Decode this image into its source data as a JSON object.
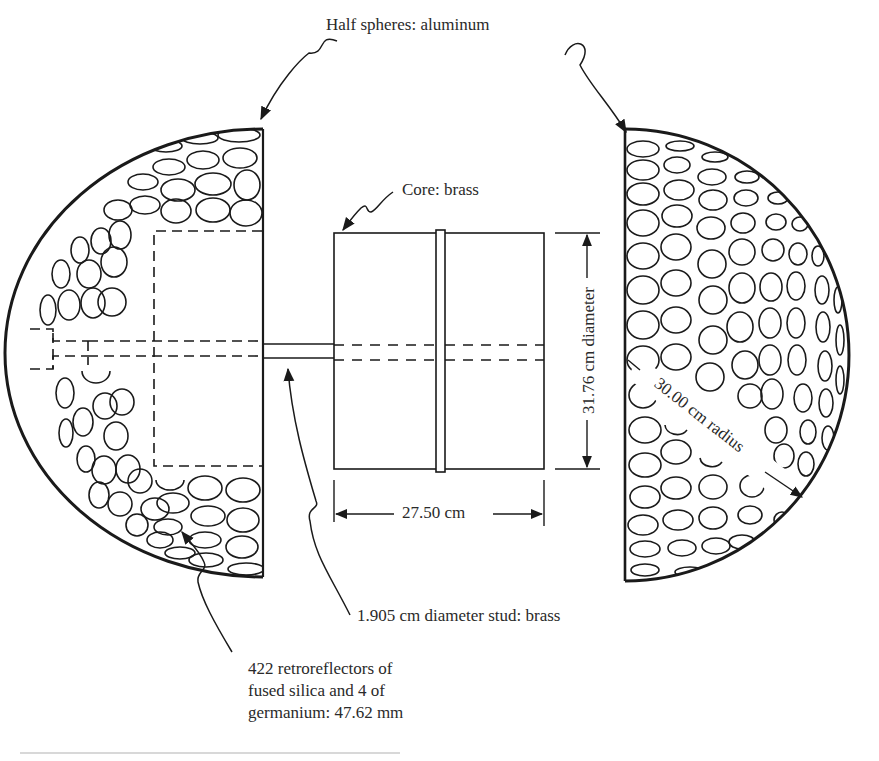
{
  "figure": {
    "labels": {
      "half_spheres": "Half spheres: aluminum",
      "core": "Core: brass",
      "diameter": "31.76 cm diameter",
      "core_length": "27.50 cm",
      "radius": "30.00 cm radius",
      "stud": "1.905 cm diameter stud: brass",
      "retroreflectors_line1": "422 retroreflectors of",
      "retroreflectors_line2": "fused silica and 4 of",
      "retroreflectors_line3": "germanium: 47.62 mm"
    },
    "parts": [
      {
        "name": "left-half-sphere",
        "material": "aluminum"
      },
      {
        "name": "right-half-sphere",
        "material": "aluminum"
      },
      {
        "name": "core",
        "material": "brass"
      },
      {
        "name": "stud",
        "material": "brass"
      }
    ],
    "dimensions": {
      "sphere_radius_cm": 30.0,
      "core_diameter_cm": 31.76,
      "core_length_cm": 27.5,
      "stud_diameter_cm": 1.905,
      "retroreflector_diameter_mm": 47.62,
      "retroreflectors_fused_silica": 422,
      "retroreflectors_germanium": 4
    },
    "colors": {
      "ink": "#1a1a1a",
      "paper": "#ffffff"
    }
  }
}
